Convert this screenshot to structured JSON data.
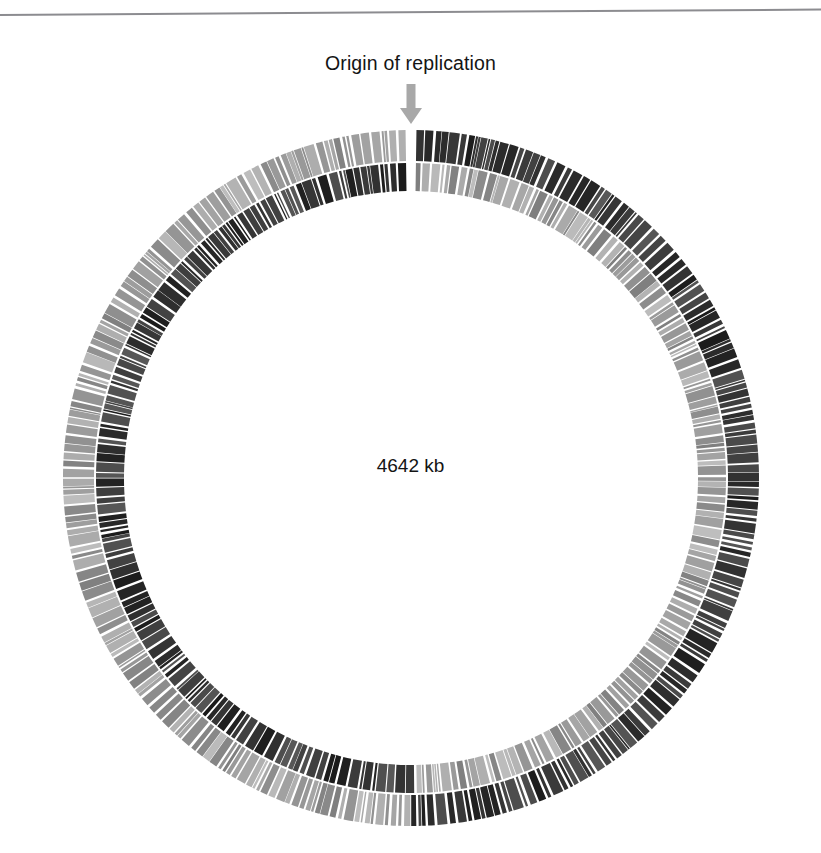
{
  "figure": {
    "type": "circular-genome-map",
    "organism_size_label": "4642 kb",
    "origin_label": "Origin of replication",
    "origin_arrow_icon": "down-arrow-icon",
    "genome_size_kb": 4642,
    "colors": {
      "dark_band": "#2a2a2a",
      "light_band": "#9a9a9a",
      "background": "#ffffff",
      "arrow": "#a8a8a8",
      "text": "#141414",
      "rule": "#8c8c90"
    },
    "geometry": {
      "center_x": 411,
      "center_y": 478,
      "outer_ring_outer_radius": 348,
      "outer_ring_inner_radius": 317,
      "inner_ring_outer_radius": 315,
      "inner_ring_inner_radius": 287,
      "origin_angle_deg": 0
    },
    "rings": [
      {
        "name": "outer-ring",
        "description": "outer gene band",
        "leading_half_color": "#2a2a2a",
        "lagging_half_color": "#9a9a9a"
      },
      {
        "name": "inner-ring",
        "description": "inner gene band",
        "leading_half_color": "#9a9a9a",
        "lagging_half_color": "#2a2a2a"
      }
    ],
    "page_rule": {
      "visible": true,
      "left_y": 11,
      "right_y": 6
    }
  },
  "chart_data": {
    "type": "circular-genome-map",
    "title": "",
    "annotations": [
      "Origin of replication",
      "4642 kb"
    ],
    "total_kb": 4642,
    "rings": 2,
    "ring_names": [
      "outer gene band",
      "inner gene band"
    ],
    "origin_position_kb": 0,
    "gene_bar_count_outer": 430,
    "gene_bar_count_inner": 430,
    "legend": [],
    "grid": false
  }
}
